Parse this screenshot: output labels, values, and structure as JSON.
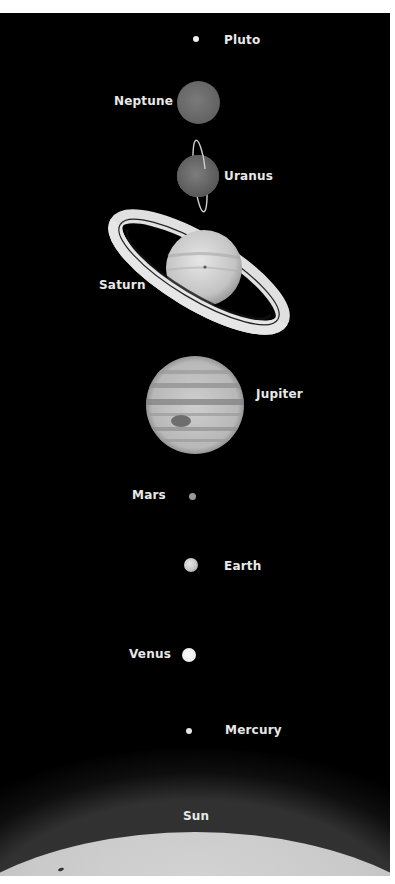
{
  "figure": {
    "background_color": "#000000",
    "label_color": "#e8e8e8"
  },
  "bodies": [
    {
      "name": "Pluto",
      "label": "Pluto"
    },
    {
      "name": "Neptune",
      "label": "Neptune"
    },
    {
      "name": "Uranus",
      "label": "Uranus"
    },
    {
      "name": "Saturn",
      "label": "Saturn"
    },
    {
      "name": "Jupiter",
      "label": "Jupiter"
    },
    {
      "name": "Mars",
      "label": "Mars"
    },
    {
      "name": "Earth",
      "label": "Earth"
    },
    {
      "name": "Venus",
      "label": "Venus"
    },
    {
      "name": "Mercury",
      "label": "Mercury"
    },
    {
      "name": "Sun",
      "label": "Sun"
    }
  ]
}
